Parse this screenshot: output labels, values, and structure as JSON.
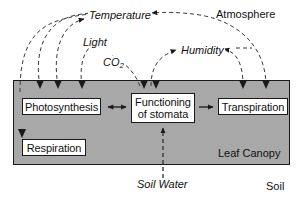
{
  "figure": {
    "type": "flow-diagram"
  },
  "regions": {
    "atmosphere_label": "Atmosphere",
    "leaf_canopy_label": "Leaf Canopy",
    "soil_label": "Soil"
  },
  "nodes": [
    {
      "id": "photosynthesis",
      "label": "Photosynthesis"
    },
    {
      "id": "stomata",
      "label": "Functioning\nof stomata",
      "line1": "Functioning",
      "line2": "of stomata"
    },
    {
      "id": "transpiration",
      "label": "Transpiration"
    },
    {
      "id": "respiration",
      "label": "Respiration"
    }
  ],
  "drivers": [
    {
      "id": "temperature",
      "label": "Temperature"
    },
    {
      "id": "light",
      "label": "Light"
    },
    {
      "id": "co2",
      "label": "CO",
      "subscript": "2"
    },
    {
      "id": "humidity",
      "label": "Humidity"
    },
    {
      "id": "soil_water",
      "label": "Soil Water"
    }
  ],
  "colors": {
    "canopy_fill": "#a8a8a8",
    "box_fill": "#ffffff",
    "stroke": "#1a1a1a",
    "page_background": "#ffffff"
  }
}
